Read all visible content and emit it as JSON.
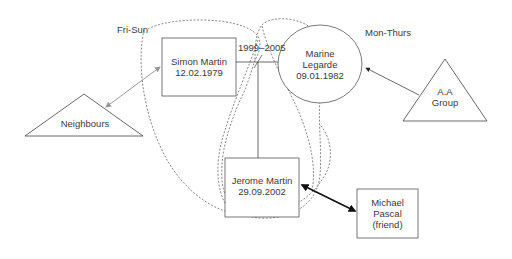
{
  "diagram": {
    "type": "ecomap",
    "groups": [
      {
        "id": "fri-sun",
        "label": "Fri-Sun"
      },
      {
        "id": "mon-thurs",
        "label": "Mon-Thurs"
      }
    ],
    "nodes": {
      "simon": {
        "line1": "Simon Martin",
        "line2": "12.02.1979",
        "shape": "rectangle"
      },
      "marine": {
        "line1": "Marine",
        "line2": "Legarde",
        "line3": "09.01.1982",
        "shape": "ellipse"
      },
      "jerome": {
        "line1": "Jerome Martin",
        "line2": "29.09.2002",
        "shape": "rectangle"
      },
      "michael": {
        "line1": "Michael",
        "line2": "Pascal",
        "line3": "(friend)",
        "shape": "rectangle"
      },
      "neighbours": {
        "line1": "Neighbours",
        "shape": "triangle"
      },
      "aa_group": {
        "line1": "A.A",
        "line2": "Group",
        "shape": "triangle"
      }
    },
    "relationship_label": "1999–2005",
    "edges": [
      {
        "from": "simon",
        "to": "marine",
        "style": "solid",
        "label": "1999–2005"
      },
      {
        "from": "simon-marine-line",
        "to": "jerome",
        "style": "solid"
      },
      {
        "from": "neighbours",
        "to": "simon",
        "style": "grey-double-arrow"
      },
      {
        "from": "aa_group",
        "to": "marine",
        "style": "single-arrow"
      },
      {
        "from": "jerome",
        "to": "michael",
        "style": "bold-double-arrow"
      }
    ],
    "colors": {
      "line": "#444444",
      "grey_arrow": "#999999",
      "bold_arrow": "#111111"
    }
  }
}
